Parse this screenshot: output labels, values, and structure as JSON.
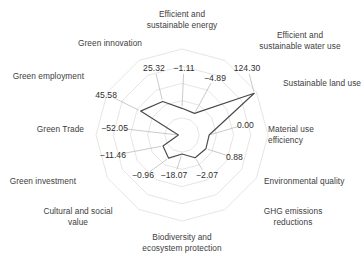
{
  "chart_data": {
    "type": "radar",
    "title": "",
    "subtitle": "",
    "xlabel": "",
    "ylabel": "",
    "grid": true,
    "legend_position": "none",
    "axis_start_angle_deg": -90,
    "axis_direction": "clockwise",
    "rings": 5,
    "categories": [
      "Efficient and\nsustainable energy",
      "Efficient and\nsustainable water use",
      "Sustainable land use",
      "Material use\nefficiency",
      "Environmental quality",
      "GHG emissions\nreductions",
      "Biodiversity and\necosystem protection",
      "Cultural and social\nvalue",
      "Green investment",
      "Green Trade",
      "Green employment",
      "Green innovation"
    ],
    "values": [
      -1.11,
      -4.89,
      124.3,
      0.0,
      0.88,
      -2.07,
      -18.07,
      -0.96,
      -11.46,
      -52.05,
      45.58,
      25.32
    ],
    "value_labels": [
      "−1.11",
      "−4.89",
      "124.30",
      "0.00",
      "0.88",
      "−2.07",
      "−18.07",
      "−0.96",
      "−11.46",
      "−52.05",
      "45.58",
      "25.32"
    ],
    "series": [
      {
        "name": "",
        "values": [
          -1.11,
          -4.89,
          124.3,
          0.0,
          0.88,
          -2.07,
          -18.07,
          -0.96,
          -11.46,
          -52.05,
          45.58,
          25.32
        ]
      }
    ],
    "rlim": [
      -60,
      130
    ],
    "colors": {
      "series_line": "#4a4a4a",
      "grid": "#e0dedc",
      "leader": "#b5b3b0",
      "text": "#3a3a3a",
      "background": "#ffffff"
    }
  },
  "layout": {
    "center_x": 182,
    "center_y": 135,
    "grid_radius": 86,
    "axis_label_positions": [
      {
        "x": 182,
        "y": 9,
        "align": "center",
        "w": 110
      },
      {
        "x": 300,
        "y": 30,
        "align": "center",
        "w": 124
      },
      {
        "x": 283,
        "y": 78,
        "align": "left",
        "w": 80
      },
      {
        "x": 268,
        "y": 124,
        "align": "left",
        "w": 80
      },
      {
        "x": 264,
        "y": 176,
        "align": "left",
        "w": 100
      },
      {
        "x": 293,
        "y": 206,
        "align": "center",
        "w": 80
      },
      {
        "x": 182,
        "y": 232,
        "align": "center",
        "w": 122
      },
      {
        "x": 78,
        "y": 206,
        "align": "center",
        "w": 104
      },
      {
        "x": 76,
        "y": 176,
        "align": "right",
        "w": 90
      },
      {
        "x": 84,
        "y": 124,
        "align": "right",
        "w": 80
      },
      {
        "x": 84,
        "y": 71,
        "align": "right",
        "w": 92
      },
      {
        "x": 110,
        "y": 38,
        "align": "center",
        "w": 92
      }
    ],
    "value_label_positions": [
      {
        "x": 184,
        "y": 68,
        "align": "center"
      },
      {
        "x": 215,
        "y": 78,
        "align": "center"
      },
      {
        "x": 247,
        "y": 68,
        "align": "center"
      },
      {
        "x": 237,
        "y": 125,
        "align": "left"
      },
      {
        "x": 226,
        "y": 157,
        "align": "left"
      },
      {
        "x": 207,
        "y": 175,
        "align": "center"
      },
      {
        "x": 174,
        "y": 175,
        "align": "center"
      },
      {
        "x": 143,
        "y": 175,
        "align": "center"
      },
      {
        "x": 126,
        "y": 155,
        "align": "right"
      },
      {
        "x": 128,
        "y": 128,
        "align": "right"
      },
      {
        "x": 117,
        "y": 95,
        "align": "right"
      },
      {
        "x": 154,
        "y": 68,
        "align": "center"
      }
    ]
  }
}
